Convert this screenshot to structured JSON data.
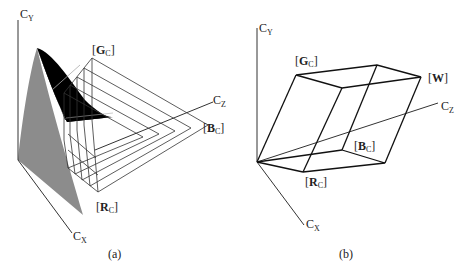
{
  "figure": {
    "panels": [
      {
        "id": "a",
        "caption": "(a)",
        "axes": {
          "y": "C",
          "y_sub": "Y",
          "x": "C",
          "x_sub": "X",
          "z": "C",
          "z_sub": "Z"
        },
        "labels": {
          "green": {
            "open": "[",
            "main": "G",
            "sub": "C",
            "close": "]"
          },
          "blue": {
            "open": "[",
            "main": "B",
            "sub": "C",
            "close": "]"
          },
          "red": {
            "open": "[",
            "main": "R",
            "sub": "C",
            "close": "]"
          }
        },
        "colors": {
          "cone_dark": "#000000",
          "cone_light": "#8c8c8c",
          "lines": "#333333"
        }
      },
      {
        "id": "b",
        "caption": "(b)",
        "axes": {
          "y": "C",
          "y_sub": "Y",
          "x": "C",
          "x_sub": "X",
          "z": "C",
          "z_sub": "Z"
        },
        "labels": {
          "green": {
            "open": "[",
            "main": "G",
            "sub": "C",
            "close": "]"
          },
          "white": {
            "open": "[",
            "main": "W",
            "sub": "",
            "close": "]"
          },
          "blue": {
            "open": "[",
            "main": "B",
            "sub": "C",
            "close": "]"
          },
          "red": {
            "open": "[",
            "main": "R",
            "sub": "C",
            "close": "]"
          }
        },
        "colors": {
          "lines": "#111111"
        }
      }
    ]
  }
}
